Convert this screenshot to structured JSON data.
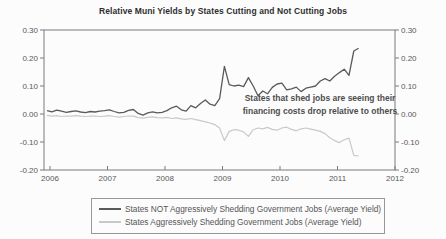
{
  "chart_data": {
    "type": "line",
    "title": "Relative Muni Yields by States Cutting and Not Cutting Jobs",
    "xlabel": "",
    "ylabel": "",
    "ylim": [
      -0.2,
      0.3
    ],
    "y_ticks": [
      0.3,
      0.2,
      0.1,
      0.0,
      -0.1,
      -0.2
    ],
    "x_ticks": [
      2006,
      2007,
      2008,
      2009,
      2010,
      2011,
      2012
    ],
    "grid": "off",
    "legend_position": "bottom",
    "frame_color": "#7a7a7a",
    "tick_label_color": "#585858",
    "x_start_year": 2005.95,
    "points_per_year": 12,
    "series": [
      {
        "name": "States NOT Aggressively Shedding Government Jobs (Average Yield)",
        "color": "#5a5a5a",
        "stroke_width": 1.3,
        "values": [
          0.012,
          0.008,
          0.014,
          0.01,
          0.006,
          0.009,
          0.011,
          0.007,
          0.005,
          0.009,
          0.007,
          0.01,
          0.012,
          0.015,
          0.009,
          0.004,
          0.006,
          0.013,
          0.016,
          0.002,
          -0.004,
          0.004,
          0.008,
          0.004,
          0.006,
          0.012,
          0.022,
          0.028,
          0.015,
          0.01,
          0.03,
          0.022,
          0.037,
          0.05,
          0.035,
          0.03,
          0.055,
          0.17,
          0.105,
          0.1,
          0.103,
          0.098,
          0.13,
          0.1,
          0.065,
          0.082,
          0.072,
          0.095,
          0.107,
          0.11,
          0.086,
          0.09,
          0.096,
          0.08,
          0.092,
          0.096,
          0.1,
          0.118,
          0.126,
          0.118,
          0.135,
          0.148,
          0.16,
          0.138,
          0.225,
          0.235
        ]
      },
      {
        "name": "States Aggressively Shedding Government Jobs (Average Yield)",
        "color": "#c9c9c9",
        "stroke_width": 1.2,
        "values": [
          -0.005,
          -0.008,
          -0.006,
          -0.009,
          -0.007,
          -0.008,
          -0.006,
          -0.008,
          -0.009,
          -0.007,
          -0.008,
          -0.009,
          -0.008,
          -0.006,
          -0.009,
          -0.011,
          -0.009,
          -0.007,
          -0.008,
          -0.013,
          -0.015,
          -0.012,
          -0.01,
          -0.013,
          -0.014,
          -0.012,
          -0.016,
          -0.014,
          -0.017,
          -0.019,
          -0.016,
          -0.02,
          -0.024,
          -0.028,
          -0.032,
          -0.038,
          -0.05,
          -0.095,
          -0.062,
          -0.056,
          -0.058,
          -0.064,
          -0.08,
          -0.056,
          -0.05,
          -0.053,
          -0.048,
          -0.055,
          -0.058,
          -0.05,
          -0.047,
          -0.055,
          -0.06,
          -0.053,
          -0.05,
          -0.054,
          -0.058,
          -0.062,
          -0.07,
          -0.085,
          -0.095,
          -0.102,
          -0.092,
          -0.086,
          -0.148,
          -0.15
        ]
      }
    ],
    "annotation": {
      "line1": "States that shed jobs are seeing their",
      "line2": "financing costs drop relative to others"
    }
  }
}
